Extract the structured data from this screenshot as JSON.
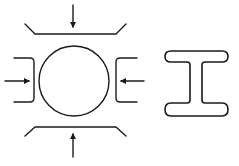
{
  "diagram": {
    "stroke_color": "#1a1a1a",
    "background": "#ffffff",
    "left_figure": {
      "label": "round-billet-with-dies",
      "circle": {
        "cx": 74,
        "cy": 81,
        "r": 35
      },
      "dies": [
        "top",
        "bottom",
        "left",
        "right"
      ],
      "force_arrows": [
        "down",
        "up",
        "right",
        "left"
      ]
    },
    "right_figure": {
      "label": "i-beam-section"
    }
  }
}
